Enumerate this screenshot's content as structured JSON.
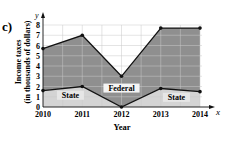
{
  "figure_label": "c)",
  "chart_data": {
    "type": "area",
    "title": "",
    "xlabel": "Year",
    "ylabel_line1": "Income taxes",
    "ylabel_line2": "(in thousands of dollars)",
    "x_axis_symbol": "x",
    "y_axis_symbol": "y",
    "categories": [
      "2010",
      "2011",
      "2012",
      "2013",
      "2014"
    ],
    "y_ticks": [
      "0",
      "1",
      "2",
      "3",
      "4",
      "5",
      "6",
      "7",
      "8"
    ],
    "ylim": [
      0,
      8
    ],
    "grid": true,
    "series": [
      {
        "name": "State",
        "values": [
          1.6,
          2.0,
          0.0,
          1.8,
          1.5
        ],
        "color": "#d4d4d4"
      },
      {
        "name": "Federal",
        "values": [
          4.1,
          5.0,
          3.0,
          5.9,
          6.2
        ],
        "color": "#8f8f8f"
      }
    ],
    "total": [
      5.7,
      7.0,
      3.0,
      7.7,
      7.7
    ],
    "annotations": [
      {
        "text": "State",
        "x": 2010.7,
        "y": 1.0
      },
      {
        "text": "Federal",
        "x": 2012,
        "y": 1.7
      },
      {
        "text": "State",
        "x": 2013.4,
        "y": 0.8
      }
    ]
  }
}
